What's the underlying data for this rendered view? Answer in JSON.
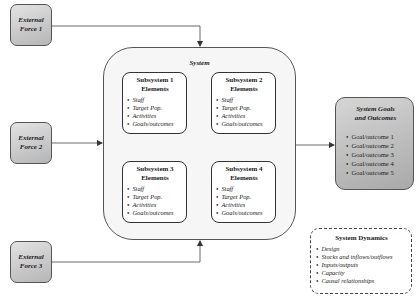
{
  "external_forces": [
    {
      "label_line1": "External",
      "label_line2": "Force 1"
    },
    {
      "label_line1": "External",
      "label_line2": "Force 2"
    },
    {
      "label_line1": "External",
      "label_line2": "Force 3"
    }
  ],
  "system": {
    "title": "System",
    "subsystems": [
      {
        "title_line1": "Subsystem 1",
        "title_line2": "Elements",
        "items": [
          "Staff",
          "Target Pop.",
          "Activities",
          "Goals/outcomes"
        ]
      },
      {
        "title_line1": "Subsystem 2",
        "title_line2": "Elements",
        "items": [
          "Staff",
          "Target Pop.",
          "Activities",
          "Goals/outcomes"
        ]
      },
      {
        "title_line1": "Subsystem 3",
        "title_line2": "Elements",
        "items": [
          "Staff",
          "Target Pop.",
          "Activities",
          "Goals/outcomes"
        ]
      },
      {
        "title_line1": "Subsystem 4",
        "title_line2": "Elements",
        "items": [
          "Staff",
          "Target Pop.",
          "Activities",
          "Goals/outcomes"
        ]
      }
    ]
  },
  "goals": {
    "title_line1": "System Goals",
    "title_line2": "and Outcomes",
    "items": [
      "Goal/outcome 1",
      "Goal/outcome 2",
      "Goal/outcome 3",
      "Goal/outcome 4",
      "Goal/outcome 5"
    ]
  },
  "dynamics": {
    "title": "System Dynamics",
    "items": [
      "Design",
      "Stocks and inflows/outflows",
      "Inputs/outputs",
      "Capacity",
      "Causal relationships"
    ]
  },
  "colors": {
    "line": "#444444",
    "force_fill": "#c4c4c4",
    "goals_fill": "#bcbcbc",
    "system_fill": "#f6f6f6"
  }
}
